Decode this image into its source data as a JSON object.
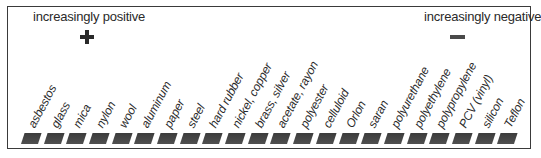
{
  "diagram": {
    "left_heading": "increasingly positive",
    "right_heading": "increasingly negative",
    "left_sign": "+",
    "right_sign": "−",
    "swatch_color": "#444444",
    "materials": [
      {
        "label": "asbestos"
      },
      {
        "label": "glass"
      },
      {
        "label": "mica"
      },
      {
        "label": "nylon"
      },
      {
        "label": "wool"
      },
      {
        "label": "aluminum"
      },
      {
        "label": "paper"
      },
      {
        "label": "steel"
      },
      {
        "label": "hard rubber"
      },
      {
        "label": "nickel, copper"
      },
      {
        "label": "brass, silver"
      },
      {
        "label": "acetate, rayon"
      },
      {
        "label": "polyester"
      },
      {
        "label": "celluloid"
      },
      {
        "label": "Orlon"
      },
      {
        "label": "saran"
      },
      {
        "label": "polyurethane"
      },
      {
        "label": "polyethylene"
      },
      {
        "label": "polypropylene"
      },
      {
        "label": "PCV (vinyl)"
      },
      {
        "label": "silicon"
      },
      {
        "label": "Teflon"
      }
    ]
  }
}
